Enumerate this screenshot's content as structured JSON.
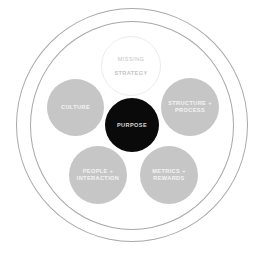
{
  "diagram": {
    "colors": {
      "background": "#ffffff",
      "ring": "#a8a8a8",
      "node_gray": "#c6c6c6",
      "node_center": "#0a0a0a",
      "node_missing_outline": "#ececec"
    },
    "rings": [
      {
        "name": "outer-ring",
        "cx": 132,
        "cy": 125,
        "r": 116
      },
      {
        "name": "inner-ring",
        "cx": 132,
        "cy": 125,
        "r": 102
      }
    ],
    "nodes": {
      "missing": {
        "line1": "MISSING",
        "line2": "STRATEGY",
        "style": "missing"
      },
      "culture": {
        "label": "CULTURE",
        "style": "gray"
      },
      "structure": {
        "label": "STRUCTURE +\nPROCESS",
        "style": "gray"
      },
      "purpose": {
        "label": "PURPOSE",
        "style": "center"
      },
      "people": {
        "label": "PEOPLE +\nINTERACTION",
        "style": "gray"
      },
      "metrics": {
        "label": "METRICS +\nREWARDS",
        "style": "gray"
      }
    }
  }
}
